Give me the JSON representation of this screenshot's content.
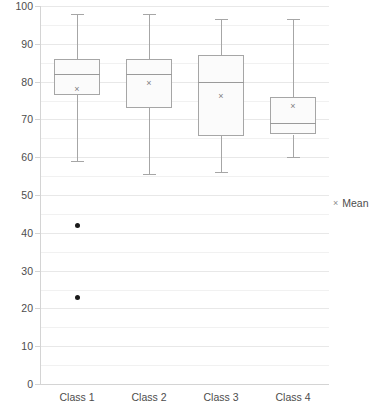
{
  "chart_data": {
    "type": "box",
    "title": "",
    "xlabel": "",
    "ylabel": "",
    "ylim": [
      0,
      100
    ],
    "y_tick_step": 10,
    "y_minor_step": 5,
    "grid": true,
    "grid_major_color": "#e8e8e8",
    "grid_minor_color": "#f1f1f1",
    "box_fill_color": "#fbfbfb",
    "box_border_color": "#a6a6a6",
    "whisker_color": "#a6a6a6",
    "median_color": "#9a9a9a",
    "mean_color": "#808080",
    "outlier_color": "#1a1a1a",
    "categories": [
      "Class 1",
      "Class 2",
      "Class 3",
      "Class 4"
    ],
    "y_tick_labels": [
      "100",
      "90",
      "80",
      "70",
      "60",
      "50",
      "40",
      "30",
      "20",
      "10",
      "0"
    ],
    "y_tick_values": [
      100,
      90,
      80,
      70,
      60,
      50,
      40,
      30,
      20,
      10,
      0
    ],
    "boxes": [
      {
        "category": "Class 1",
        "whisker_low": 59,
        "q1": 76.5,
        "median": 82,
        "q3": 86,
        "whisker_high": 98,
        "mean": 78,
        "outliers": [
          42,
          23
        ]
      },
      {
        "category": "Class 2",
        "whisker_low": 55.5,
        "q1": 73,
        "median": 82,
        "q3": 86,
        "whisker_high": 98,
        "mean": 79.5,
        "outliers": []
      },
      {
        "category": "Class 3",
        "whisker_low": 56,
        "q1": 65.5,
        "median": 80,
        "q3": 87,
        "whisker_high": 96.5,
        "mean": 76,
        "outliers": []
      },
      {
        "category": "Class 4",
        "whisker_low": 60,
        "q1": 66,
        "median": 69,
        "q3": 76,
        "whisker_high": 96.5,
        "mean": 73.5,
        "outliers": []
      }
    ],
    "legend": {
      "position": "right",
      "entries": [
        {
          "label": "Mean",
          "marker": "×"
        }
      ]
    }
  }
}
